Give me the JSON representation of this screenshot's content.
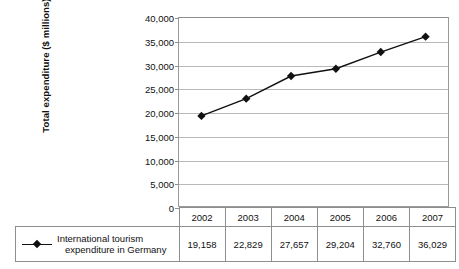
{
  "chart_data": {
    "type": "line",
    "title": "",
    "xlabel": "",
    "ylabel": "Total expenditure ($ millions)",
    "categories": [
      "2002",
      "2003",
      "2004",
      "2005",
      "2006",
      "2007"
    ],
    "series": [
      {
        "name": "International tourism expenditure in Germany",
        "name_line1": "International tourism",
        "name_line2": "expenditure in Germany",
        "values": [
          19158,
          22829,
          27657,
          29204,
          32760,
          36029
        ],
        "value_labels": [
          "19,158",
          "22,829",
          "27,657",
          "29,204",
          "32,760",
          "36,029"
        ],
        "color": "#111111",
        "marker": "diamond"
      }
    ],
    "ylim": [
      0,
      40000
    ],
    "ytick_values": [
      0,
      5000,
      10000,
      15000,
      20000,
      25000,
      30000,
      35000,
      40000
    ],
    "ytick_labels": [
      "0",
      "5,000",
      "10,000",
      "15,000",
      "20,000",
      "25,000",
      "30,000",
      "35,000",
      "40,000"
    ],
    "grid": true,
    "grid_axis": "y",
    "legend_position": "table-left",
    "data_table": {
      "header_row": [
        "2002",
        "2003",
        "2004",
        "2005",
        "2006",
        "2007"
      ],
      "value_row": [
        "19,158",
        "22,829",
        "27,657",
        "29,204",
        "32,760",
        "36,029"
      ]
    }
  },
  "colors": {
    "series": "#111111",
    "gridline": "#b9b9b9",
    "border": "#8e8e8e",
    "background": "#ffffff",
    "text": "#111111"
  }
}
